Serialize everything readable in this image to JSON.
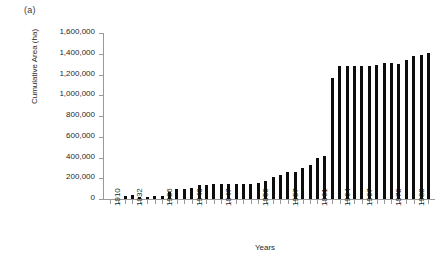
{
  "figure": {
    "panel_label": "(a)",
    "background_color": "#ffffff",
    "bar_color": "#0d0d0d",
    "axis_color": "#9a9a9a"
  },
  "chart_data": {
    "type": "bar",
    "title": "",
    "xlabel": "Years",
    "ylabel": "Cumulative Area (ha)",
    "ylim": [
      0,
      1600000
    ],
    "grid": false,
    "legend": null,
    "ytick_labels": [
      "1,600,000",
      "1,400,000",
      "1,200,000",
      "1,000,000",
      "800,000",
      "600,000",
      "400,000",
      "200,000",
      "0"
    ],
    "ytick_values": [
      1600000,
      1400000,
      1200000,
      1000000,
      800000,
      600000,
      400000,
      200000,
      0
    ],
    "xtick_labels": [
      "1910",
      "1932",
      "1936",
      "1940",
      "1947",
      "1953",
      "1957",
      "1961",
      "1964",
      "1967",
      "1978",
      "1988"
    ],
    "categories": [
      "1910",
      "1930",
      "1931",
      "1932",
      "1933",
      "1934",
      "1935",
      "1936",
      "1937",
      "1938",
      "1939",
      "1940",
      "1941",
      "1945",
      "1946",
      "1947",
      "1948",
      "1950",
      "1951",
      "1952",
      "1953",
      "1954",
      "1955",
      "1956",
      "1957",
      "1958",
      "1959",
      "1960",
      "1961",
      "1962",
      "1963",
      "1964",
      "1965",
      "1966",
      "1967",
      "1968",
      "1970",
      "1974",
      "1978",
      "1982",
      "1985",
      "1988",
      "1990",
      "1993"
    ],
    "values": [
      0,
      0,
      30000,
      35000,
      20000,
      20000,
      25000,
      25000,
      70000,
      95000,
      100000,
      105000,
      135000,
      135000,
      140000,
      140000,
      140000,
      140000,
      140000,
      145000,
      150000,
      175000,
      215000,
      235000,
      260000,
      265000,
      300000,
      330000,
      395000,
      415000,
      1170000,
      1280000,
      1280000,
      1280000,
      1280000,
      1280000,
      1290000,
      1310000,
      1310000,
      1300000,
      1340000,
      1380000,
      1385000,
      1410000
    ]
  }
}
